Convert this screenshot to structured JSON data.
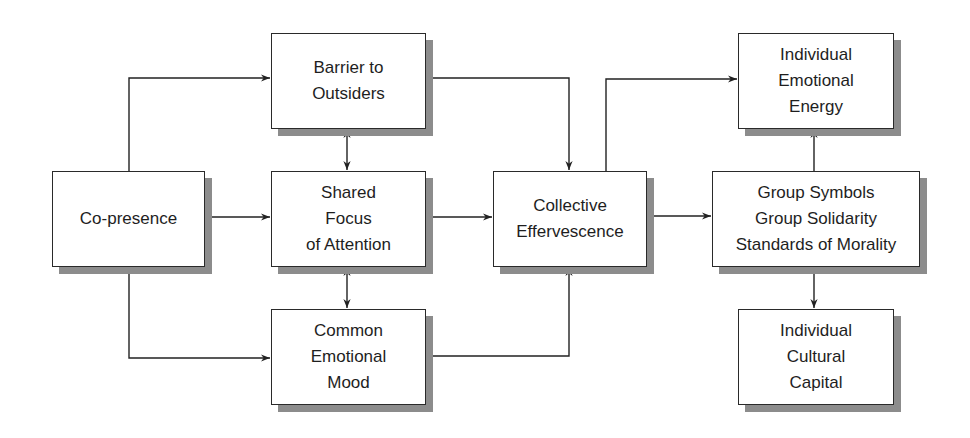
{
  "diagram": {
    "type": "flowchart",
    "colors": {
      "border": "#2a2a2a",
      "shadow": "#8c8c8c",
      "line": "#222222",
      "background": "#ffffff"
    },
    "nodes": {
      "copresence": {
        "label": "Co-presence"
      },
      "barrier": {
        "label": "Barrier to\nOutsiders"
      },
      "shared_focus": {
        "label": "Shared\nFocus\nof Attention"
      },
      "common_mood": {
        "label": "Common\nEmotional\nMood"
      },
      "collective": {
        "label": "Collective\nEffervescence"
      },
      "emotional_energy": {
        "label": "Individual\nEmotional\nEnergy"
      },
      "group": {
        "label": "Group Symbols\nGroup Solidarity\nStandards of Morality"
      },
      "cultural_capital": {
        "label": "Individual\nCultural\nCapital"
      }
    },
    "edges": [
      {
        "from": "copresence",
        "to": "barrier",
        "type": "arrow"
      },
      {
        "from": "copresence",
        "to": "shared_focus",
        "type": "arrow"
      },
      {
        "from": "copresence",
        "to": "common_mood",
        "type": "arrow"
      },
      {
        "from": "barrier",
        "to": "shared_focus",
        "type": "bidirectional"
      },
      {
        "from": "shared_focus",
        "to": "common_mood",
        "type": "bidirectional"
      },
      {
        "from": "barrier",
        "to": "collective",
        "type": "arrow"
      },
      {
        "from": "shared_focus",
        "to": "collective",
        "type": "arrow"
      },
      {
        "from": "common_mood",
        "to": "collective",
        "type": "arrow"
      },
      {
        "from": "collective",
        "to": "emotional_energy",
        "type": "arrow"
      },
      {
        "from": "collective",
        "to": "group",
        "type": "arrow"
      },
      {
        "from": "group",
        "to": "emotional_energy",
        "type": "arrow"
      },
      {
        "from": "group",
        "to": "cultural_capital",
        "type": "arrow"
      }
    ]
  }
}
